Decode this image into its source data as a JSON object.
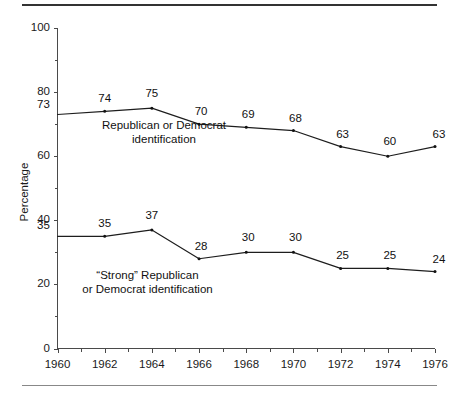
{
  "figure": {
    "background_color": "#ffffff",
    "line_color": "#1d1d1d",
    "axis_color": "#4a4a4a",
    "top_rule_color": "#333333",
    "bottom_rule_color": "#888888"
  },
  "chart_data": {
    "type": "line",
    "title": "",
    "subtitle": "",
    "xlabel": "",
    "ylabel": "Percentage",
    "xlim": [
      1960,
      1976
    ],
    "ylim": [
      0,
      100
    ],
    "grid": false,
    "legend_position": "inline-annotation",
    "x": [
      1960,
      1962,
      1964,
      1966,
      1968,
      1970,
      1972,
      1974,
      1976
    ],
    "x_tick_labels": [
      "1960",
      "1962",
      "1964",
      "1966",
      "1968",
      "1970",
      "1972",
      "1974",
      "1976"
    ],
    "x_minor_ticks": [
      1961,
      1963,
      1965,
      1967,
      1969,
      1971,
      1973,
      1975
    ],
    "y_tick_labels": [
      "0",
      "20",
      "40",
      "60",
      "80",
      "100"
    ],
    "y_ticks": [
      0,
      20,
      40,
      60,
      80,
      100
    ],
    "y_minor_ticks": [
      10,
      30,
      50,
      70,
      90
    ],
    "series": [
      {
        "name": "Republican or Democrat identification",
        "values": [
          73,
          74,
          75,
          70,
          69,
          68,
          63,
          60,
          63
        ],
        "data_labels": [
          "73",
          "74",
          "75",
          "70",
          "69",
          "68",
          "63",
          "60",
          "63"
        ]
      },
      {
        "name": "“Strong” Republican or Democrat identification",
        "values": [
          35,
          35,
          37,
          28,
          30,
          30,
          25,
          25,
          24
        ],
        "data_labels": [
          "35",
          "35",
          "37",
          "28",
          "30",
          "30",
          "25",
          "25",
          "24"
        ]
      }
    ],
    "annotations": [
      {
        "id": "upper",
        "line1": "Republican or Democrat",
        "line2": "identification"
      },
      {
        "id": "lower",
        "line1": "“Strong” Republican",
        "line2": "or Democrat identification"
      }
    ]
  }
}
